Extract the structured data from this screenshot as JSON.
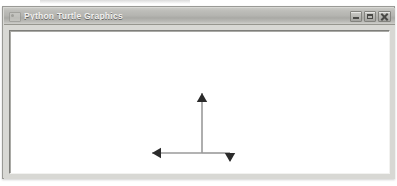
{
  "window": {
    "title": "Python Turtle Graphics",
    "icon": "turtle-app-icon",
    "controls": [
      {
        "name": "minimize-button",
        "glyph": "minimize",
        "label": "Minimize"
      },
      {
        "name": "maximize-button",
        "glyph": "maximize",
        "label": "Maximize"
      },
      {
        "name": "close-button",
        "glyph": "close",
        "label": "Close"
      }
    ]
  },
  "canvas": {
    "name": "turtle-drawing-canvas",
    "background": "#ffffff",
    "width": 379,
    "height": 142,
    "pen_color": "#9a9a9a",
    "arrow_color": "#2b2b2b",
    "pen_width": 1.6,
    "drawing": {
      "description": "turtle-path-three-segments",
      "segments": [
        {
          "name": "vertical-up-stroke",
          "x1": 192,
          "y1": 122,
          "x2": 192,
          "y2": 62
        },
        {
          "name": "horizontal-left-stroke",
          "x1": 192,
          "y1": 122,
          "x2": 142,
          "y2": 122
        },
        {
          "name": "horizontal-right-stroke",
          "x1": 192,
          "y1": 122,
          "x2": 220,
          "y2": 122
        },
        {
          "name": "short-down-stroke",
          "x1": 220,
          "y1": 122,
          "x2": 220,
          "y2": 130
        }
      ],
      "arrowheads": [
        {
          "name": "turtle-cursor-up",
          "x": 192,
          "y": 62,
          "direction": "up"
        },
        {
          "name": "arrowhead-left",
          "x": 142,
          "y": 122,
          "direction": "left"
        },
        {
          "name": "arrowhead-down",
          "x": 220,
          "y": 131,
          "direction": "down"
        }
      ]
    }
  }
}
